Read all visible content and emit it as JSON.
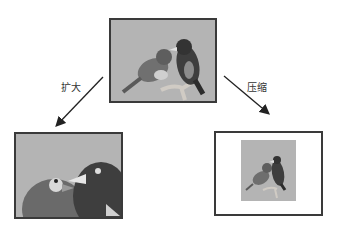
{
  "diagram": {
    "title": "",
    "nodes": [
      {
        "id": "original",
        "description": "original image: two birds on a branch"
      },
      {
        "id": "enlarged",
        "description": "enlarged image: cropped close-up of two bird heads"
      },
      {
        "id": "compressed",
        "description": "compressed image: small birds image centered in white frame"
      }
    ],
    "edges": [
      {
        "from": "original",
        "to": "enlarged",
        "label": "扩大"
      },
      {
        "from": "original",
        "to": "compressed",
        "label": "压缩"
      }
    ]
  },
  "labels": {
    "enlarge": "扩大",
    "compress": "压缩"
  },
  "colors": {
    "photo_bg": "#b4b4b4",
    "border": "#3a3a3a",
    "bird_dark": "#3c3c3c",
    "bird_mid": "#6e6e6e"
  }
}
